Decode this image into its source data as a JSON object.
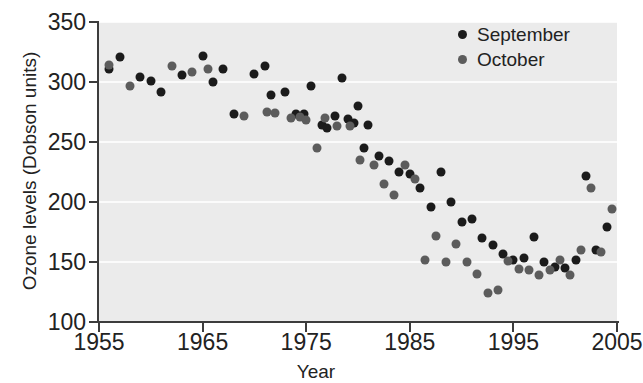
{
  "chart_data": {
    "type": "scatter",
    "title": "",
    "xlabel": "Year",
    "ylabel": "Ozone levels (Dobson units)",
    "xlim": [
      1955,
      2005
    ],
    "ylim": [
      100,
      350
    ],
    "xticks": [
      1955,
      1965,
      1975,
      1985,
      1995,
      2005
    ],
    "yticks": [
      100,
      150,
      200,
      250,
      300,
      350
    ],
    "grid": "horizontal-white",
    "legend_position": "top-right",
    "colors": {
      "september": "#1b1b1b",
      "october": "#5c5c5c",
      "plot_background": "#ebebeb",
      "gridline": "#fbfbfb",
      "axis": "#3c3c3c",
      "text": "#222222"
    },
    "series": [
      {
        "name": "September",
        "color": "#1b1b1b",
        "points": [
          [
            1956,
            311
          ],
          [
            1957,
            321
          ],
          [
            1959,
            304
          ],
          [
            1960,
            301
          ],
          [
            1961,
            292
          ],
          [
            1963,
            306
          ],
          [
            1965,
            322
          ],
          [
            1966,
            300
          ],
          [
            1967,
            311
          ],
          [
            1968,
            273
          ],
          [
            1970,
            307
          ],
          [
            1971,
            313
          ],
          [
            1971.6,
            289
          ],
          [
            1973,
            292
          ],
          [
            1974,
            273
          ],
          [
            1974.8,
            273
          ],
          [
            1975.5,
            297
          ],
          [
            1976.5,
            264
          ],
          [
            1977,
            262
          ],
          [
            1977.8,
            272
          ],
          [
            1978.5,
            303
          ],
          [
            1979,
            269
          ],
          [
            1979.6,
            266
          ],
          [
            1980,
            280
          ],
          [
            1980.6,
            245
          ],
          [
            1981,
            264
          ],
          [
            1982,
            238
          ],
          [
            1983,
            234
          ],
          [
            1984,
            225
          ],
          [
            1985,
            223
          ],
          [
            1986,
            212
          ],
          [
            1987,
            196
          ],
          [
            1988,
            225
          ],
          [
            1989,
            200
          ],
          [
            1990,
            183
          ],
          [
            1991,
            186
          ],
          [
            1992,
            170
          ],
          [
            1993,
            164
          ],
          [
            1994,
            157
          ],
          [
            1995,
            152
          ],
          [
            1996,
            153
          ],
          [
            1997,
            171
          ],
          [
            1998,
            150
          ],
          [
            1999,
            146
          ],
          [
            2000,
            145
          ],
          [
            2001,
            152
          ],
          [
            2002,
            222
          ],
          [
            2003,
            160
          ],
          [
            2004,
            179
          ]
        ]
      },
      {
        "name": "October",
        "color": "#5c5c5c",
        "points": [
          [
            1956,
            314
          ],
          [
            1958,
            297
          ],
          [
            1962,
            313
          ],
          [
            1964,
            308
          ],
          [
            1965.5,
            311
          ],
          [
            1969,
            272
          ],
          [
            1971.2,
            275
          ],
          [
            1972,
            274
          ],
          [
            1973.5,
            270
          ],
          [
            1974.4,
            271
          ],
          [
            1975,
            268
          ],
          [
            1976,
            245
          ],
          [
            1976.8,
            270
          ],
          [
            1978,
            263
          ],
          [
            1979.2,
            263
          ],
          [
            1980.2,
            235
          ],
          [
            1981.5,
            231
          ],
          [
            1982.5,
            215
          ],
          [
            1983.5,
            206
          ],
          [
            1984.5,
            231
          ],
          [
            1985.5,
            219
          ],
          [
            1986.5,
            152
          ],
          [
            1987.5,
            172
          ],
          [
            1988.5,
            150
          ],
          [
            1989.5,
            165
          ],
          [
            1990.5,
            150
          ],
          [
            1991.5,
            140
          ],
          [
            1992.5,
            124
          ],
          [
            1993.5,
            127
          ],
          [
            1994.5,
            151
          ],
          [
            1995.5,
            144
          ],
          [
            1996.5,
            143
          ],
          [
            1997.5,
            139
          ],
          [
            1998.5,
            143
          ],
          [
            1999.5,
            152
          ],
          [
            2000.5,
            139
          ],
          [
            2001.5,
            160
          ],
          [
            2002.5,
            212
          ],
          [
            2003.5,
            158
          ],
          [
            2004.5,
            194
          ]
        ]
      }
    ]
  },
  "legend": {
    "items": [
      {
        "label": "September",
        "color": "#1b1b1b"
      },
      {
        "label": "October",
        "color": "#5c5c5c"
      }
    ]
  }
}
